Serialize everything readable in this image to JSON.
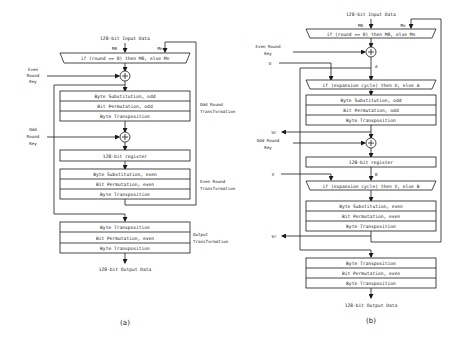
{
  "diagram_a": {
    "caption": "(a)",
    "input_label": "128-bit Input Data",
    "mux_inputs": {
      "left": "M0",
      "right": "Mn"
    },
    "mux_label": "if (round == 0) then M0, else Mn",
    "even_key": [
      "Even",
      "Round",
      "Key"
    ],
    "odd_key": [
      "Odd",
      "Round",
      "Key"
    ],
    "odd_round": {
      "steps": [
        "Byte Substitution, odd",
        "Bit Permutation, odd",
        "Byte Transposition"
      ],
      "label": [
        "Odd Round",
        "Transformation"
      ]
    },
    "register": "128-bit register",
    "even_round": {
      "steps": [
        "Byte Substitution, even",
        "Bit Permutation, even",
        "Byte Transposition"
      ],
      "label": [
        "Even Round",
        "Transformation"
      ]
    },
    "output": {
      "steps": [
        "Byte Transposition",
        "Bit Permutation, even",
        "Byte Transposition"
      ],
      "label": [
        "Output",
        "Transformation"
      ]
    },
    "output_label": "128-bit Output Data"
  },
  "diagram_b": {
    "caption": "(b)",
    "input_label": "128-bit Input Data",
    "mux_inputs": {
      "left": "M0",
      "right": "Mn"
    },
    "mux_label": "if (round == 0) then M0, else Mn",
    "even_key": [
      "Even Round",
      "Key"
    ],
    "u_label": "U",
    "a_label": "A",
    "mux_u_label": "if (expansion cycle) then U, else A",
    "odd_round_steps": [
      "Byte Substitution, odd",
      "Bit Permutation, odd",
      "Byte Transposition"
    ],
    "ur_label": "Ur",
    "odd_key": [
      "Odd Round",
      "Key"
    ],
    "register": "128-bit register",
    "v_label": "V",
    "b_label": "B",
    "mux_v_label": "if (expansion cycle) then V, else B",
    "even_round_steps": [
      "Byte Substitution, even",
      "Bit Permutation, even",
      "Byte Transposition"
    ],
    "vr_label": "Vr",
    "output_steps": [
      "Byte Transposition",
      "Bit Permutation, even",
      "Byte Transposition"
    ],
    "output_label": "128-bit Output Data"
  }
}
